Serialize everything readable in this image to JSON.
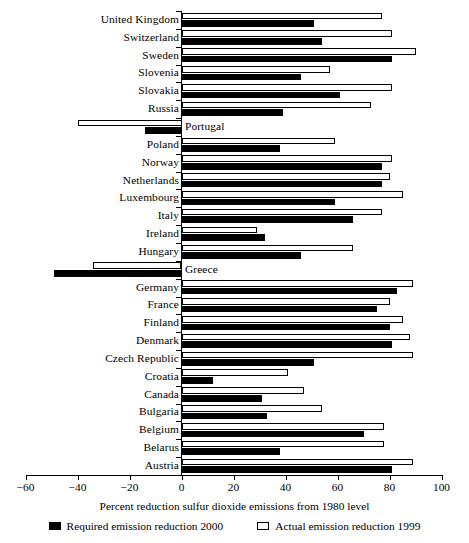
{
  "chart_data": {
    "type": "bar",
    "orientation": "horizontal",
    "title": "",
    "xlabel": "Percent reduction sulfur dioxide emissions from 1980 level",
    "ylabel": "",
    "xlim": [
      -60,
      100
    ],
    "xticks": [
      -60,
      -40,
      -20,
      0,
      20,
      40,
      60,
      80,
      100
    ],
    "xtick_labels": [
      "−60",
      "−40",
      "−20",
      "0",
      "20",
      "40",
      "60",
      "80",
      "100"
    ],
    "grid": false,
    "legend_position": "bottom",
    "legend": [
      {
        "name": "Required emission reduction 2000",
        "style": "filled",
        "color": "#000000"
      },
      {
        "name": "Actual emission reduction 1999",
        "style": "hollow",
        "color": "#ffffff"
      }
    ],
    "categories": [
      "United Kingdom",
      "Switzerland",
      "Sweden",
      "Slovenia",
      "Slovakia",
      "Russia",
      "Portugal",
      "Poland",
      "Norway",
      "Netherlands",
      "Luxembourg",
      "Italy",
      "Ireland",
      "Hungary",
      "Greece",
      "Germany",
      "France",
      "Finland",
      "Denmark",
      "Czech Republic",
      "Croatia",
      "Canada",
      "Bulgaria",
      "Belgium",
      "Belarus",
      "Austria"
    ],
    "series": [
      {
        "name": "Actual emission reduction 1999",
        "values": [
          77,
          81,
          90,
          57,
          81,
          73,
          -40,
          59,
          81,
          80,
          85,
          77,
          29,
          66,
          -34,
          89,
          80,
          85,
          88,
          89,
          41,
          47,
          54,
          78,
          78,
          89
        ]
      },
      {
        "name": "Required emission reduction 2000",
        "values": [
          51,
          54,
          81,
          46,
          61,
          39,
          -14,
          38,
          77,
          77,
          59,
          66,
          32,
          46,
          -49,
          83,
          75,
          80,
          81,
          51,
          12,
          31,
          33,
          70,
          38,
          81
        ]
      }
    ]
  }
}
